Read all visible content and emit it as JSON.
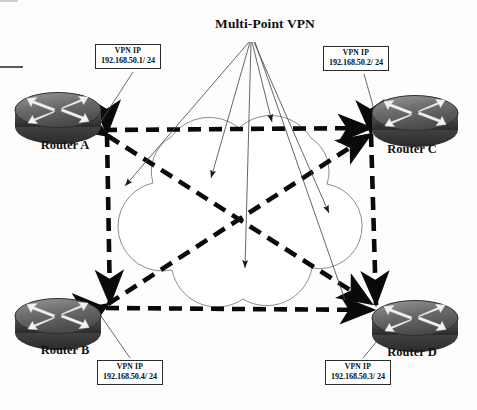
{
  "diagram": {
    "title": "Multi-Point VPN",
    "type": "network-topology",
    "cloud": {
      "name": "vpn-cloud",
      "stroke": "#8a8a8a"
    },
    "tunnel_color": "#0a0a0a",
    "routers": [
      {
        "id": "a",
        "label": "Router A",
        "position": "top-left",
        "vpn_ip_title": "VPN IP",
        "vpn_ip": "192.168.50.1/ 24"
      },
      {
        "id": "c",
        "label": "Router C",
        "position": "top-right",
        "vpn_ip_title": "VPN IP",
        "vpn_ip": "192.168.50.2/ 24"
      },
      {
        "id": "b",
        "label": "Router B",
        "position": "bottom-left",
        "vpn_ip_title": "VPN IP",
        "vpn_ip": "192.168.50.4/ 24"
      },
      {
        "id": "d",
        "label": "Router D",
        "position": "bottom-right",
        "vpn_ip_title": "VPN IP",
        "vpn_ip": "192.168.50.3/ 24"
      }
    ],
    "tunnels": [
      {
        "from": "Router A",
        "to": "Router C",
        "style": "dashed",
        "bidirectional": true
      },
      {
        "from": "Router A",
        "to": "Router B",
        "style": "dashed",
        "bidirectional": true
      },
      {
        "from": "Router C",
        "to": "Router D",
        "style": "dashed",
        "bidirectional": true
      },
      {
        "from": "Router B",
        "to": "Router D",
        "style": "dashed",
        "bidirectional": true
      },
      {
        "from": "Router A",
        "to": "Router D",
        "style": "dashed",
        "bidirectional": true
      },
      {
        "from": "Router B",
        "to": "Router C",
        "style": "dashed",
        "bidirectional": true
      }
    ]
  }
}
